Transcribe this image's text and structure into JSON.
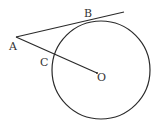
{
  "diagram": {
    "labels": {
      "A": "A",
      "B": "B",
      "C": "C",
      "O": "O"
    },
    "colors": {
      "stroke": "#2a2a2a",
      "text": "#333333",
      "background": "#ffffff"
    }
  }
}
